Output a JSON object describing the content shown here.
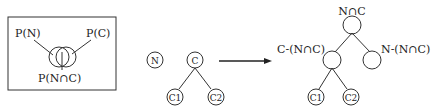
{
  "venn_panel": {
    "label_left": "P(N)",
    "label_right": "P(C)",
    "label_bottom": "P(N∩C)"
  },
  "input_nodes": {
    "standalone": "N",
    "root": "C",
    "child_left": "C1",
    "child_right": "C2"
  },
  "arrow": {
    "direction": "right"
  },
  "output_tree": {
    "root_label": "N∩C",
    "left_label": "C-(N∩C)",
    "right_label": "N-(N∩C)",
    "child_left": "C1",
    "child_right": "C2"
  }
}
